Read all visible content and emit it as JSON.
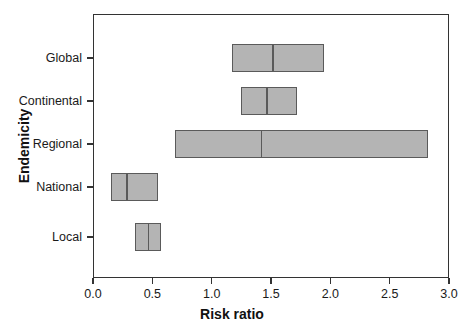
{
  "chart_data": {
    "type": "bar",
    "title": "",
    "xlabel": "Risk ratio",
    "ylabel": "Endemicity",
    "xlim": [
      0.0,
      3.0
    ],
    "xticks": [
      "0.0",
      "0.5",
      "1.0",
      "1.5",
      "2.0",
      "2.5",
      "3.0"
    ],
    "xtick_values": [
      0.0,
      0.5,
      1.0,
      1.5,
      2.0,
      2.5,
      3.0
    ],
    "grid": false,
    "legend": null,
    "orientation": "horizontal",
    "categories": [
      "Global",
      "Continental",
      "Regional",
      "National",
      "Local"
    ],
    "bars": [
      {
        "category": "Global",
        "low": 1.17,
        "median": 1.51,
        "high": 1.95
      },
      {
        "category": "Continental",
        "low": 1.25,
        "median": 1.46,
        "high": 1.72
      },
      {
        "category": "Regional",
        "low": 0.69,
        "median": 1.41,
        "high": 2.82
      },
      {
        "category": "National",
        "low": 0.15,
        "median": 0.28,
        "high": 0.55
      },
      {
        "category": "Local",
        "low": 0.35,
        "median": 0.46,
        "high": 0.57
      }
    ],
    "colors": {
      "bar_fill": "#b4b4b4",
      "bar_edge": "#5a5a5a",
      "axis": "#333333",
      "text": "#1a1a1a",
      "background": "#ffffff"
    }
  }
}
